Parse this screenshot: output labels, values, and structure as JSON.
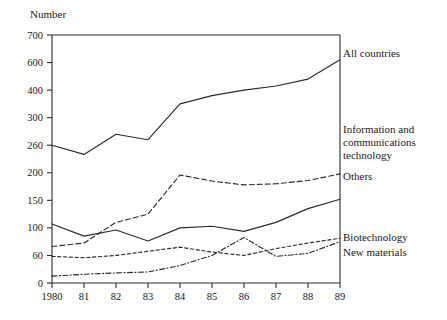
{
  "chart_data": {
    "type": "line",
    "title": "",
    "ylabel": "Number",
    "xlabel": "",
    "grid": false,
    "legend_position": "right-inline",
    "x": [
      1980,
      1981,
      1982,
      1983,
      1984,
      1985,
      1986,
      1987,
      1988,
      1989
    ],
    "categories": [
      "1980",
      "81",
      "82",
      "83",
      "84",
      "85",
      "86",
      "87",
      "88",
      "89"
    ],
    "ytick_values": [
      0,
      60,
      100,
      150,
      200,
      260,
      300,
      400,
      600,
      700
    ],
    "ytick_labels": [
      "0",
      "60",
      "100",
      "150",
      "200",
      "260",
      "300",
      "400",
      "600",
      "700"
    ],
    "yaxis_scale": "non-linear (equal spacing between listed ticks)",
    "ylim": [
      0,
      700
    ],
    "series": [
      {
        "name": "All countries",
        "style": "solid",
        "values": [
          260,
          240,
          276,
          268,
          350,
          380,
          400,
          430,
          480,
          610
        ]
      },
      {
        "name": "Information and communications technology",
        "style": "dashed",
        "values": [
          73,
          78,
          110,
          125,
          196,
          185,
          178,
          180,
          186,
          198
        ]
      },
      {
        "name": "Others",
        "style": "solid",
        "values": [
          107,
          88,
          97,
          81,
          100,
          103,
          95,
          110,
          135,
          152
        ]
      },
      {
        "name": "Biotechnology",
        "style": "shortdash",
        "values": [
          58,
          55,
          60,
          66,
          72,
          65,
          60,
          70,
          78,
          85
        ]
      },
      {
        "name": "New materials",
        "style": "dashdot",
        "values": [
          15,
          19,
          22,
          24,
          38,
          60,
          86,
          58,
          63,
          80
        ]
      }
    ],
    "labels": [
      {
        "text": "All countries",
        "x": 343,
        "y": 57
      },
      {
        "text": "Information and",
        "x": 343,
        "y": 133
      },
      {
        "text": "communications",
        "x": 343,
        "y": 146
      },
      {
        "text": "technology",
        "x": 343,
        "y": 159
      },
      {
        "text": "Others",
        "x": 343,
        "y": 180
      },
      {
        "text": "Biotechnology",
        "x": 343,
        "y": 241
      },
      {
        "text": "New materials",
        "x": 343,
        "y": 256
      }
    ]
  },
  "colors": {
    "ink": "#1a1a1a",
    "axis": "#2b2b2b",
    "background": "#ffffff"
  }
}
